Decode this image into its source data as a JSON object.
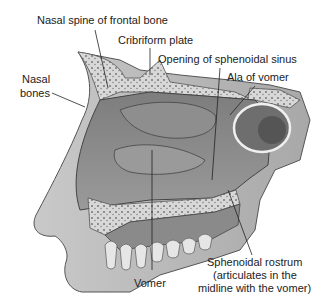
{
  "figure": {
    "labels": [
      {
        "id": "nasal-spine",
        "text": [
          "Nasal spine of frontal bone"
        ]
      },
      {
        "id": "cribriform",
        "text": [
          "Cribriform plate"
        ]
      },
      {
        "id": "sphenoidal-sinus",
        "text": [
          "Opening of sphenoidal sinus"
        ]
      },
      {
        "id": "ala-vomer",
        "text": [
          "Ala of vomer"
        ]
      },
      {
        "id": "nasal-bones",
        "text": [
          "Nasal",
          "bones"
        ]
      },
      {
        "id": "vomer",
        "text": [
          "Vomer"
        ]
      },
      {
        "id": "sphenoidal-rostrum",
        "text": [
          "Sphenoidal rostrum",
          "(articulates in the",
          "midline with the vomer)"
        ]
      }
    ]
  }
}
